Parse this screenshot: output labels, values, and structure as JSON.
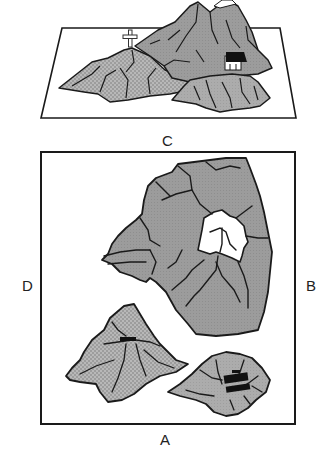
{
  "figure": {
    "perspective_view": {
      "viewpoint_label": "C",
      "landmarks": [
        "cross",
        "hut",
        "snow-capped peak"
      ]
    },
    "plan_view": {
      "side_labels": {
        "top": "",
        "bottom": "A",
        "left": "D",
        "right": "B"
      },
      "mountains": [
        {
          "name": "large mountain",
          "feature": "snow cap",
          "fill": "gray"
        },
        {
          "name": "small mountain",
          "feature": "cross",
          "fill": "dotted"
        },
        {
          "name": "medium mountain",
          "feature": "hut",
          "fill": "light gray"
        }
      ]
    },
    "labels": {
      "c": "C",
      "a": "A",
      "b": "B",
      "d": "D"
    },
    "colors": {
      "outline": "#1a1a1a",
      "mountain_gray": "#9a9a9a",
      "mountain_light": "#ababab",
      "dotted_fill": "#b4b4b4",
      "snow": "#ffffff",
      "background": "#ffffff"
    }
  }
}
